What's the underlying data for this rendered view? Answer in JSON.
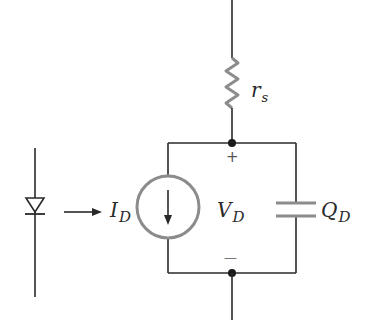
{
  "diagram": {
    "type": "circuit",
    "colors": {
      "wire": "#2a2a2a",
      "component": "#8c8c8c"
    },
    "labels": {
      "resistor": {
        "main": "r",
        "sub": "s"
      },
      "current": {
        "main": "I",
        "sub": "D"
      },
      "voltage": {
        "main": "V",
        "sub": "D"
      },
      "charge": {
        "main": "Q",
        "sub": "D"
      },
      "plus": "+",
      "minus": "—"
    },
    "components": [
      {
        "name": "diode",
        "symbol": "diode-icon"
      },
      {
        "name": "arrow",
        "symbol": "right-arrow-icon"
      },
      {
        "name": "series-resistor",
        "symbol": "resistor-icon"
      },
      {
        "name": "current-source",
        "symbol": "current-source-icon",
        "direction": "down"
      },
      {
        "name": "capacitor",
        "symbol": "capacitor-icon"
      }
    ]
  }
}
